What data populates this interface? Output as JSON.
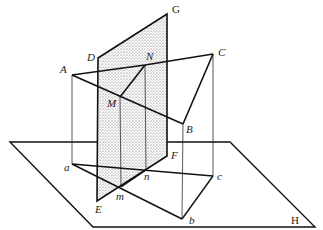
{
  "diagram": {
    "labels": {
      "A": "A",
      "B": "B",
      "C": "C",
      "D": "D",
      "G": "G",
      "M": "M",
      "N": "N",
      "E": "E",
      "F": "F",
      "H": "H",
      "a": "a",
      "b": "b",
      "c": "c",
      "m": "m",
      "n": "n"
    },
    "colors": {
      "line": "#111111",
      "shade": "#cfcfcf"
    }
  }
}
